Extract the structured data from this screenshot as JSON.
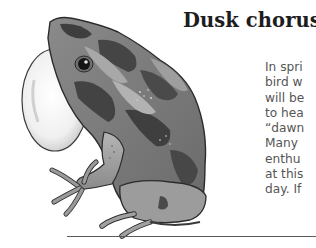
{
  "article": {
    "heading": "Dusk chorus",
    "body_lines": [
      "In spri",
      "bird w",
      "will be",
      "to hea",
      "“dawn",
      "Many",
      "enthu",
      "at this",
      "day. If"
    ]
  },
  "illustration": {
    "subject": "frog-with-inflated-vocal-sac",
    "style": "grayscale-painted",
    "colors": {
      "outline": "#2b2b2b",
      "light_skin": "#a9a9a9",
      "dark_patch": "#4a4a4a",
      "vocal_sac": "#f2f2f2"
    }
  },
  "rule": {
    "color": "#5a5a5a"
  }
}
